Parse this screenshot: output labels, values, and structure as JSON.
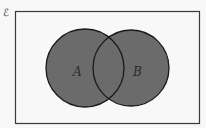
{
  "diagram": {
    "type": "venn",
    "universal_symbol": "ℰ",
    "sets": [
      {
        "label": "A",
        "cx": 85,
        "cy": 68,
        "r": 39
      },
      {
        "label": "B",
        "cx": 131,
        "cy": 68,
        "r": 38
      }
    ],
    "shaded_region": "A ∪ B",
    "colors": {
      "background": "#f8f8f8",
      "fill": "#6b6b6b",
      "stroke": "#1a1a1a",
      "frame": "#3a3a3a"
    }
  }
}
